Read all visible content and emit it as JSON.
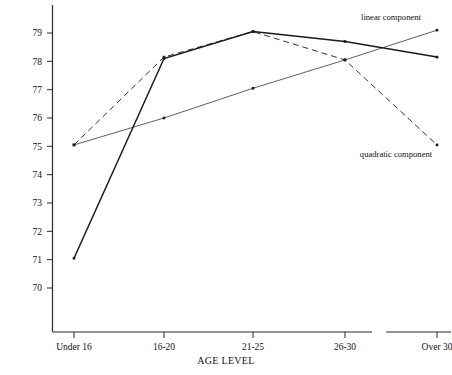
{
  "chart_data": {
    "type": "line",
    "title": "",
    "xlabel": "AGE LEVEL",
    "ylabel": "",
    "categories": [
      "Under 16",
      "16-20",
      "21-25",
      "26-30",
      "Over 30"
    ],
    "ylim": [
      69.3,
      79.6
    ],
    "yticks": [
      70,
      71,
      72,
      73,
      74,
      75,
      76,
      77,
      78,
      79
    ],
    "ytick_labels": [
      "70",
      "71",
      "72",
      "73",
      "74",
      "75",
      "76",
      "77",
      "78",
      "79"
    ],
    "grid": false,
    "legend_position": "inline-annotations",
    "axis_break": {
      "present": true,
      "between": [
        "26-30",
        "Over 30"
      ],
      "note": "x-axis rule is interrupted between the 26-30 and Over 30 categories"
    },
    "series": [
      {
        "name": "observed",
        "style": "solid-thick",
        "color": "#1a1a1a",
        "values": [
          71.05,
          78.1,
          79.05,
          78.7,
          78.15
        ]
      },
      {
        "name": "linear component",
        "style": "solid-thin",
        "color": "#1a1a1a",
        "values": [
          75.05,
          76.0,
          77.05,
          78.05,
          79.1
        ]
      },
      {
        "name": "quadratic component",
        "style": "dashed",
        "color": "#1a1a1a",
        "values": [
          75.05,
          78.15,
          79.05,
          78.05,
          75.05
        ]
      }
    ],
    "annotations": [
      {
        "name": "linear-component-label",
        "text": "linear component",
        "x_px": 391,
        "y_px": 20
      },
      {
        "name": "quadratic-component-label",
        "text": "quadratic component",
        "x_px": 396,
        "y_px": 157
      }
    ]
  },
  "axis": {
    "x_title": "AGE LEVEL",
    "tick_labels_x": [
      "Under 16",
      "16-20",
      "21-25",
      "26-30",
      "Over 30"
    ],
    "tick_labels_y": [
      "79",
      "78",
      "77",
      "76",
      "75",
      "74",
      "73",
      "72",
      "71",
      "70"
    ]
  },
  "labels": {
    "linear": "linear component",
    "quadratic": "quadratic component"
  },
  "colors": {
    "ink": "#1a1a1a",
    "background": "#ffffff"
  }
}
